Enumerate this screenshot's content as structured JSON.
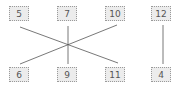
{
  "diagram": {
    "top_row": [
      {
        "label": "5",
        "x": 9,
        "y": 6
      },
      {
        "label": "7",
        "x": 57,
        "y": 6
      },
      {
        "label": "10",
        "x": 105,
        "y": 6
      },
      {
        "label": "12",
        "x": 151,
        "y": 6
      }
    ],
    "bottom_row": [
      {
        "label": "6",
        "x": 9,
        "y": 67
      },
      {
        "label": "9",
        "x": 57,
        "y": 67
      },
      {
        "label": "11",
        "x": 105,
        "y": 67
      },
      {
        "label": "4",
        "x": 151,
        "y": 67
      }
    ],
    "connections": [
      {
        "from": "5",
        "to": "11"
      },
      {
        "from": "10",
        "to": "6"
      },
      {
        "from": "7",
        "to": "9"
      },
      {
        "from": "12",
        "to": "4"
      }
    ],
    "colors": {
      "box_fill": "#ececec",
      "box_border": "#9a9a9a",
      "line": "#555555",
      "text": "#555555"
    }
  }
}
